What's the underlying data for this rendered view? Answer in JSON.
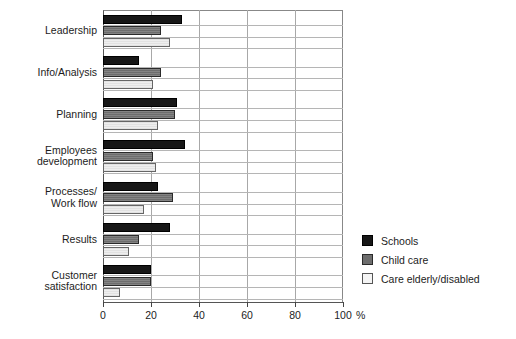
{
  "chart_data": {
    "type": "bar",
    "orientation": "horizontal",
    "title": "",
    "xlabel": "%",
    "ylabel": "",
    "xlim": [
      0,
      100
    ],
    "xticks": [
      0,
      20,
      40,
      60,
      80,
      100
    ],
    "xtick_labels": [
      "0",
      "20",
      "40",
      "60",
      "80",
      "100"
    ],
    "axis_unit": "%",
    "grid": true,
    "legend_position": "right-bottom",
    "categories": [
      "Leadership",
      "Info/Analysis",
      "Planning",
      "Employees\ndevelopment",
      "Processes/\nWork flow",
      "Results",
      "Customer\nsatisfaction"
    ],
    "series": [
      {
        "name": "Schools",
        "color": "#171717",
        "values": [
          33,
          15,
          31,
          34,
          23,
          28,
          20
        ]
      },
      {
        "name": "Child care",
        "color": "#6d6d6d",
        "values": [
          24,
          24,
          30,
          21,
          29,
          15,
          20
        ]
      },
      {
        "name": "Care elderly/disabled",
        "color": "#eeeeee",
        "values": [
          28,
          21,
          23,
          22,
          17,
          11,
          7
        ]
      }
    ]
  },
  "legend": {
    "items": [
      {
        "label": "Schools"
      },
      {
        "label": "Child care"
      },
      {
        "label": "Care elderly/disabled"
      }
    ]
  }
}
